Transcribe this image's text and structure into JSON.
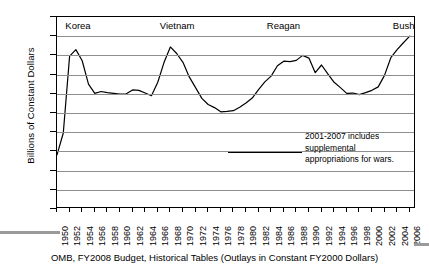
{
  "figure": {
    "caption": "OMB, FY2008 Budget, Historical Tables (Outlays in Constant FY2000 Dollars)",
    "annotation_lines": [
      "2001-2007 includes",
      "supplemental",
      "appropriations for wars."
    ]
  },
  "chart_data": {
    "type": "line",
    "title": "",
    "xlabel": "",
    "ylabel": "Billions of  Constant Dollars",
    "ylim": [
      0,
      500
    ],
    "yticks": [
      0,
      50,
      100,
      150,
      200,
      250,
      300,
      350,
      400,
      450,
      500
    ],
    "xlim": [
      1950,
      2007
    ],
    "xticks": [
      1950,
      1952,
      1954,
      1956,
      1958,
      1960,
      1962,
      1964,
      1966,
      1968,
      1970,
      1972,
      1974,
      1976,
      1978,
      1980,
      1982,
      1984,
      1986,
      1988,
      1990,
      1992,
      1994,
      1996,
      1998,
      2000,
      2002,
      2004,
      2006
    ],
    "grid": true,
    "legend": "none",
    "line_color": "#000000",
    "series": [
      {
        "name": "Defense Outlays",
        "x": [
          1950,
          1951,
          1952,
          1953,
          1954,
          1955,
          1956,
          1957,
          1958,
          1959,
          1960,
          1961,
          1962,
          1963,
          1964,
          1965,
          1966,
          1967,
          1968,
          1969,
          1970,
          1971,
          1972,
          1973,
          1974,
          1975,
          1976,
          1977,
          1978,
          1979,
          1980,
          1981,
          1982,
          1983,
          1984,
          1985,
          1986,
          1987,
          1988,
          1989,
          1990,
          1991,
          1992,
          1993,
          1994,
          1995,
          1996,
          1997,
          1998,
          1999,
          2000,
          2001,
          2002,
          2003,
          2004,
          2005,
          2006
        ],
        "values": [
          141,
          198,
          398,
          415,
          386,
          325,
          301,
          306,
          303,
          301,
          299,
          300,
          310,
          309,
          302,
          295,
          330,
          382,
          422,
          405,
          382,
          344,
          316,
          288,
          272,
          264,
          253,
          254,
          256,
          265,
          276,
          289,
          311,
          331,
          346,
          373,
          385,
          384,
          387,
          400,
          393,
          355,
          375,
          352,
          330,
          316,
          301,
          302,
          298,
          303,
          309,
          318,
          348,
          394,
          415,
          433,
          450
        ],
        "units": "Billions of Constant FY2000 Dollars"
      }
    ],
    "era_annotations": [
      {
        "label": "Korea",
        "x": 1951
      },
      {
        "label": "Vietnam",
        "x": 1966
      },
      {
        "label": "Reagan",
        "x": 1983
      },
      {
        "label": "Bush",
        "x": 2003
      }
    ]
  }
}
